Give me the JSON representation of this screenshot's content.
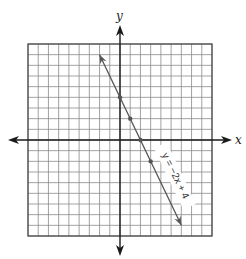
{
  "chart_data": {
    "type": "line",
    "title": "",
    "xlabel": "x",
    "ylabel": "y",
    "xlim": [
      -9,
      9
    ],
    "ylim": [
      -9,
      9
    ],
    "grid": true,
    "grid_step": 1,
    "series": [
      {
        "name": "y = -2x + 4",
        "equation": "y = -2x + 4",
        "slope": -2,
        "intercept": 4,
        "x": [
          -2,
          0,
          1,
          2,
          3,
          6
        ],
        "y": [
          8,
          4,
          2,
          0,
          -2,
          -8
        ],
        "marked_points": [
          [
            0,
            4
          ],
          [
            1,
            2
          ],
          [
            2,
            0
          ],
          [
            3,
            -2
          ]
        ],
        "arrows_at_ends": true
      }
    ]
  },
  "labels": {
    "x_axis": "x",
    "y_axis": "y",
    "equation": "y = −2x + 4"
  },
  "colors": {
    "grid": "#8a8a8a",
    "axis": "#1a1a1a",
    "line": "#555555",
    "background": "#ffffff"
  }
}
